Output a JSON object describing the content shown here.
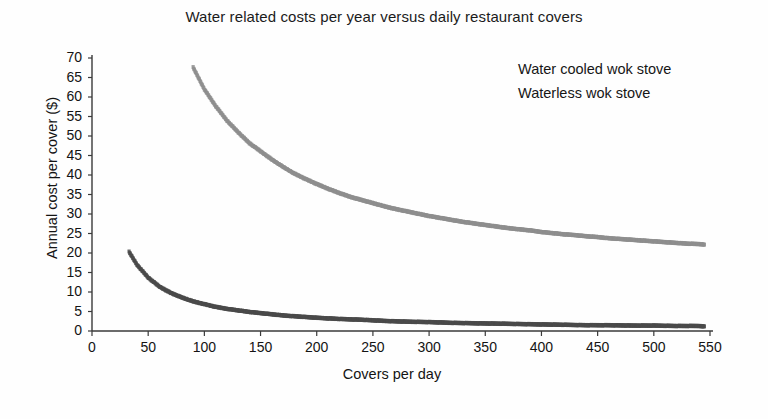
{
  "chart_data": {
    "type": "scatter",
    "title": "Water related costs per year versus daily restaurant covers",
    "xlabel": "Covers per day",
    "ylabel": "Annual cost per cover ($)",
    "xlim": [
      0,
      550
    ],
    "ylim": [
      0,
      70
    ],
    "xticks": [
      0,
      50,
      100,
      150,
      200,
      250,
      300,
      350,
      400,
      450,
      500,
      550
    ],
    "yticks": [
      0,
      5,
      10,
      15,
      20,
      25,
      30,
      35,
      40,
      45,
      50,
      55,
      60,
      65,
      70
    ],
    "grid": false,
    "legend_position": "top-right",
    "series": [
      {
        "name": "Water cooled wok stove",
        "color": "#8e8e8e",
        "x": [
          90,
          100,
          110,
          120,
          130,
          140,
          150,
          160,
          170,
          180,
          190,
          200,
          210,
          220,
          230,
          240,
          250,
          260,
          270,
          280,
          290,
          300,
          310,
          320,
          330,
          340,
          350,
          360,
          370,
          380,
          390,
          400,
          410,
          420,
          430,
          440,
          450,
          460,
          470,
          480,
          490,
          500,
          510,
          520,
          530,
          540,
          545
        ],
        "y": [
          67.6,
          62.0,
          57.7,
          54.0,
          51.0,
          48.2,
          46.1,
          44.0,
          42.1,
          40.4,
          39.0,
          37.7,
          36.5,
          35.4,
          34.4,
          33.6,
          32.8,
          32.0,
          31.3,
          30.7,
          30.1,
          29.5,
          29.0,
          28.5,
          28.0,
          27.6,
          27.2,
          26.8,
          26.4,
          26.1,
          25.8,
          25.4,
          25.1,
          24.8,
          24.6,
          24.3,
          24.1,
          23.8,
          23.6,
          23.4,
          23.2,
          23.0,
          22.8,
          22.6,
          22.4,
          22.3,
          22.2
        ]
      },
      {
        "name": "Waterless wok stove",
        "color": "#4a4a4a",
        "x": [
          33,
          40,
          50,
          60,
          70,
          80,
          90,
          100,
          110,
          120,
          130,
          140,
          150,
          160,
          170,
          180,
          190,
          200,
          220,
          240,
          260,
          280,
          300,
          320,
          340,
          360,
          380,
          400,
          420,
          440,
          460,
          480,
          500,
          520,
          540,
          545
        ],
        "y": [
          20.3,
          17.0,
          13.7,
          11.4,
          9.8,
          8.6,
          7.6,
          6.9,
          6.2,
          5.7,
          5.3,
          4.9,
          4.6,
          4.3,
          4.0,
          3.8,
          3.6,
          3.4,
          3.1,
          2.9,
          2.6,
          2.4,
          2.3,
          2.1,
          2.0,
          1.9,
          1.8,
          1.7,
          1.6,
          1.5,
          1.5,
          1.4,
          1.4,
          1.3,
          1.3,
          1.2
        ]
      }
    ]
  },
  "axis": {
    "y_tick_labels": [
      "70",
      "65",
      "60",
      "55",
      "50",
      "45",
      "40",
      "35",
      "30",
      "25",
      "20",
      "15",
      "10",
      "5",
      "0"
    ],
    "x_tick_labels": [
      "0",
      "50",
      "100",
      "150",
      "200",
      "250",
      "300",
      "350",
      "400",
      "450",
      "500",
      "550"
    ]
  },
  "colors": {
    "series1": "#8e8e8e",
    "series2": "#4a4a4a",
    "axis": "#3a3a3a",
    "text": "#141414",
    "background": "#fefefe"
  }
}
